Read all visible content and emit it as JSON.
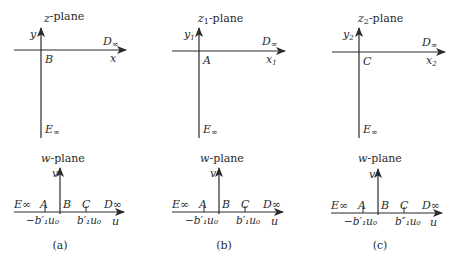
{
  "figure": {
    "panels": [
      {
        "id": "a",
        "caption": "(a)",
        "upper": {
          "title_var": "z",
          "title_sub": "",
          "title_suffix": "-plane",
          "x_axis": "x",
          "x_sub": "",
          "y_axis": "y",
          "y_sub": "",
          "origin_label": "B",
          "right_label": "D",
          "right_label_sub": "∞",
          "bottom_label": "E",
          "bottom_label_sub": "∞"
        },
        "lower": {
          "title_var": "w",
          "title_suffix": "-plane",
          "u_axis": "u",
          "v_axis": "v",
          "points": [
            "E∞",
            "A",
            "B",
            "C",
            "D∞"
          ],
          "tick_left": "−b′₁u₀",
          "tick_right": "b′₁u₀"
        }
      },
      {
        "id": "b",
        "caption": "(b)",
        "upper": {
          "title_var": "z",
          "title_sub": "1",
          "title_suffix": "-plane",
          "x_axis": "x",
          "x_sub": "1",
          "y_axis": "y",
          "y_sub": "1",
          "origin_label": "A",
          "right_label": "D",
          "right_label_sub": "∞",
          "bottom_label": "E",
          "bottom_label_sub": "∞"
        },
        "lower": {
          "title_var": "w",
          "title_suffix": "-plane",
          "u_axis": "u",
          "v_axis": "v",
          "points": [
            "E∞",
            "A",
            "B",
            "C",
            "D∞"
          ],
          "tick_left": "−b′₁u₀",
          "tick_right": "b′₁u₀"
        }
      },
      {
        "id": "c",
        "caption": "(c)",
        "upper": {
          "title_var": "z",
          "title_sub": "2",
          "title_suffix": "-plane",
          "x_axis": "x",
          "x_sub": "2",
          "y_axis": "y",
          "y_sub": "2",
          "origin_label": "C",
          "right_label": "D",
          "right_label_sub": "∞",
          "bottom_label": "E",
          "bottom_label_sub": "∞"
        },
        "lower": {
          "title_var": "w",
          "title_suffix": "-plane",
          "u_axis": "u",
          "v_axis": "v",
          "points": [
            "E∞",
            "A",
            "B",
            "C",
            "D∞"
          ],
          "tick_left": "−b′₁u₀",
          "tick_right": "b″₁u₀"
        }
      }
    ],
    "colors": {
      "ink": "#2a2a2a",
      "background": "#ffffff"
    }
  }
}
